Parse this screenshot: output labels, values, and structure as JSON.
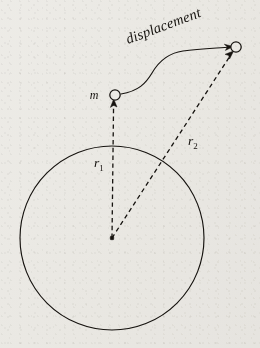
{
  "figure": {
    "background_color": "#f2f1ee",
    "ink_color": "#16130f"
  },
  "labels": {
    "displacement": "displacement",
    "mass": "m",
    "r1_base": "r",
    "r1_sub": "1",
    "r2_base": "r",
    "r2_sub": "2"
  },
  "geometry": {
    "planet_circle": {
      "cx": 112,
      "cy": 238,
      "r": 92
    },
    "center_dot": {
      "cx": 112,
      "cy": 238,
      "size": 3.4
    },
    "start_marker": {
      "cx": 115,
      "cy": 95,
      "r": 5.2
    },
    "end_marker": {
      "cx": 236,
      "cy": 47,
      "r": 5.2
    },
    "r1_vector": {
      "x1": 112,
      "y1": 238,
      "x2": 114,
      "y2": 101
    },
    "r2_vector": {
      "x1": 112,
      "y1": 238,
      "x2": 232,
      "y2": 53
    },
    "displacement_path": "M 121 94 C 139 91 146 83 152 73 C 159 61 168 53 183 51 C 200 49 219 48 230 47",
    "displacement_label_rotation": -20.5,
    "displacement_label_anchor": {
      "x": 128,
      "y": 44
    },
    "r1_label_anchor": {
      "x": 94,
      "y": 167
    },
    "r2_label_anchor": {
      "x": 188,
      "y": 145
    },
    "m_label_anchor": {
      "x": 94,
      "y": 99
    }
  }
}
